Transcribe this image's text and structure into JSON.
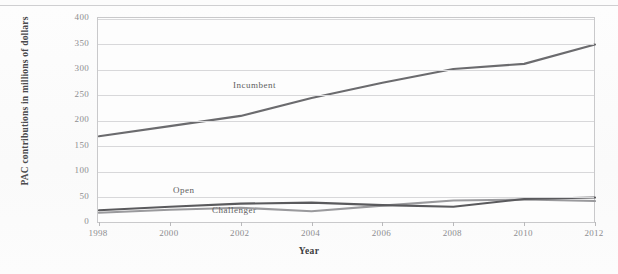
{
  "chart_data": {
    "type": "line",
    "title": "",
    "xlabel": "Year",
    "ylabel": "PAC contributions in millions of dollars",
    "x": [
      1998,
      2000,
      2002,
      2004,
      2006,
      2008,
      2010,
      2012
    ],
    "xtick_labels": [
      "1998",
      "2000",
      "2002",
      "2004",
      "2006",
      "2008",
      "2010",
      "2012"
    ],
    "ytick_labels": [
      "0",
      "50",
      "100",
      "150",
      "200",
      "250",
      "300",
      "350",
      "400"
    ],
    "ytick_values": [
      0,
      50,
      100,
      150,
      200,
      250,
      300,
      350,
      400
    ],
    "ylim": [
      0,
      400
    ],
    "xlim": [
      1998,
      2012
    ],
    "grid": "horizontal",
    "legend": "inline-annotations",
    "series": [
      {
        "name": "Incumbent",
        "color": "#6b6b6e",
        "values": [
          170,
          190,
          210,
          245,
          275,
          302,
          312,
          350
        ]
      },
      {
        "name": "Open",
        "color": "#5a5a5d",
        "values": [
          25,
          32,
          38,
          40,
          35,
          32,
          47,
          50
        ]
      },
      {
        "name": "Challenger",
        "color": "#9a9a9d",
        "values": [
          20,
          26,
          30,
          23,
          34,
          44,
          46,
          43
        ]
      }
    ]
  },
  "annotations": {
    "incumbent": "Incumbent",
    "open": "Open",
    "challenger": "Challenger"
  }
}
